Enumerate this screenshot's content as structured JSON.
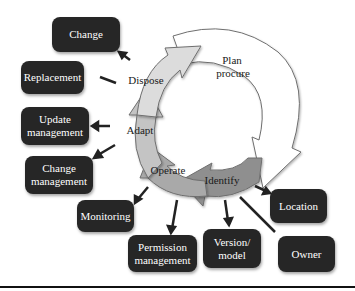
{
  "diagram": {
    "stages": [
      {
        "id": "plan",
        "label_line1": "Plan",
        "label_line2": "procure",
        "fill": "#ffffff"
      },
      {
        "id": "identify",
        "label": "Identify",
        "fill": "#8f8f8f"
      },
      {
        "id": "operate",
        "label": "Operate",
        "fill": "#a9a9a9"
      },
      {
        "id": "adapt",
        "label": "Adapt",
        "fill": "#c4c4c4"
      },
      {
        "id": "dispose",
        "label": "Dispose",
        "fill": "#dcdcdc"
      }
    ],
    "boxes": {
      "change": "Change",
      "replacement": "Replacement",
      "update_management": "Update\nmanagement",
      "change_management": "Change\nmanagement",
      "monitoring": "Monitoring",
      "permission_management": "Permission\nmanagement",
      "version_model": "Version/\nmodel",
      "location": "Location",
      "owner": "Owner"
    },
    "colors": {
      "box_fill": "#262626",
      "box_text": "#ffffff",
      "arrow": "#222222",
      "outline": "#6e6e6e"
    }
  }
}
